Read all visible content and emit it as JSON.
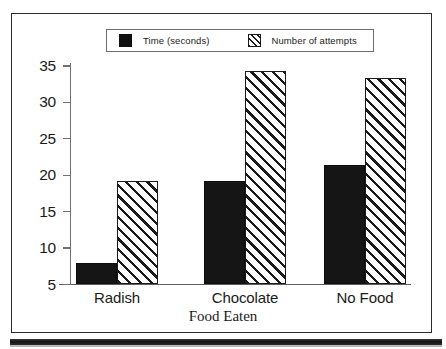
{
  "legend": {
    "entries": [
      {
        "label": "Time (seconds)",
        "swatch": "solid-black-square-icon"
      },
      {
        "label": "Number of attempts",
        "swatch": "diagonal-hatch-square-icon"
      }
    ]
  },
  "axes": {
    "y_ticks": [
      "35",
      "30",
      "25",
      "20",
      "15",
      "10",
      "5"
    ],
    "x_title": "Food Eaten",
    "x_categories": [
      "Radish",
      "Chocolate",
      "No Food"
    ]
  },
  "chart_data": {
    "type": "bar",
    "title": "",
    "subtitle": "",
    "xlabel": "Food Eaten",
    "ylabel": "",
    "categories": [
      "Radish",
      "Chocolate",
      "No Food"
    ],
    "series": [
      {
        "name": "Time (seconds)",
        "values": [
          8,
          19.2,
          21.4
        ],
        "fill": "solid-black"
      },
      {
        "name": "Number of attempts",
        "values": [
          19.2,
          34.3,
          33.4
        ],
        "fill": "diagonal-hatch"
      }
    ],
    "ylim": [
      5,
      35
    ],
    "ytick_values": [
      5,
      10,
      15,
      20,
      25,
      30,
      35
    ],
    "grid": false,
    "legend_position": "top-center",
    "annotations": []
  },
  "colors": {
    "series_time": "#151515",
    "series_attempts": "#ffffff",
    "hatch_stroke": "#1a1a1a",
    "axis": "#6f6f6f",
    "frame": "#2b2b2b",
    "text": "#1b1b1b"
  }
}
